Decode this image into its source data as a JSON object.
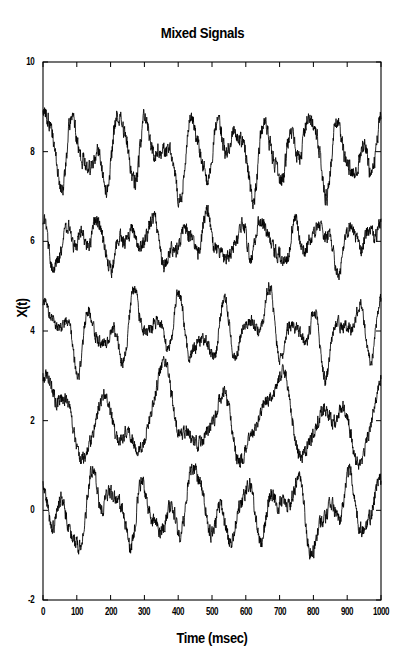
{
  "figure": {
    "title": "Mixed Signals",
    "background_color": "#ffffff",
    "line_color": "#000000",
    "axis_color": "#000000"
  },
  "axes": {
    "x_label": "Time (msec)",
    "y_label": "X(t)",
    "x_ticks": [
      "0",
      "100",
      "200",
      "300",
      "400",
      "500",
      "600",
      "700",
      "800",
      "900",
      "1000"
    ],
    "y_ticks": [
      "-2",
      "0",
      "2",
      "4",
      "6",
      "8",
      "10"
    ]
  },
  "chart_data": {
    "type": "line",
    "title": "Mixed Signals",
    "xlabel": "Time (msec)",
    "ylabel": "X(t)",
    "xlim": [
      0,
      1000
    ],
    "ylim": [
      -2,
      10
    ],
    "xticks": [
      0,
      100,
      200,
      300,
      400,
      500,
      600,
      700,
      800,
      900,
      1000
    ],
    "yticks": [
      -2,
      0,
      2,
      4,
      6,
      8,
      10
    ],
    "grid": false,
    "legend": "none",
    "n_series": 5,
    "series": [
      {
        "name": "mixture-1",
        "offset": 8,
        "amplitude": 0.95,
        "noise": 0.09,
        "components": [
          {
            "freq_hz": 14.0,
            "amp": 0.52,
            "phase": 0.3
          },
          {
            "freq_hz": 9.0,
            "amp": 0.4,
            "phase": 1.7
          },
          {
            "freq_hz": 23.0,
            "amp": 0.2,
            "phase": 2.4
          },
          {
            "freq_hz": 4.0,
            "amp": 0.22,
            "phase": 0.9
          }
        ]
      },
      {
        "name": "mixture-2",
        "offset": 6,
        "amplitude": 0.7,
        "noise": 0.08,
        "components": [
          {
            "freq_hz": 12.0,
            "amp": 0.42,
            "phase": 2.1
          },
          {
            "freq_hz": 19.0,
            "amp": 0.26,
            "phase": 0.45
          },
          {
            "freq_hz": 6.0,
            "amp": 0.3,
            "phase": 3.0
          },
          {
            "freq_hz": 27.0,
            "amp": 0.14,
            "phase": 1.1
          }
        ]
      },
      {
        "name": "mixture-3",
        "offset": 4,
        "amplitude": 0.9,
        "noise": 0.07,
        "components": [
          {
            "freq_hz": 15.0,
            "amp": 0.48,
            "phase": 1.25
          },
          {
            "freq_hz": 8.0,
            "amp": 0.34,
            "phase": 0.1
          },
          {
            "freq_hz": 22.0,
            "amp": 0.18,
            "phase": 2.75
          },
          {
            "freq_hz": 3.0,
            "amp": 0.24,
            "phase": 1.9
          }
        ]
      },
      {
        "name": "mixture-4",
        "offset": 2,
        "amplitude": 1.05,
        "noise": 0.075,
        "components": [
          {
            "freq_hz": 6.0,
            "amp": 0.62,
            "phase": 0.7
          },
          {
            "freq_hz": 11.0,
            "amp": 0.28,
            "phase": 2.3
          },
          {
            "freq_hz": 3.0,
            "amp": 0.3,
            "phase": 1.05
          },
          {
            "freq_hz": 17.0,
            "amp": 0.12,
            "phase": 0.25
          }
        ]
      },
      {
        "name": "mixture-5",
        "offset": 0,
        "amplitude": 0.95,
        "noise": 0.085,
        "components": [
          {
            "freq_hz": 13.0,
            "amp": 0.45,
            "phase": 2.55
          },
          {
            "freq_hz": 7.0,
            "amp": 0.38,
            "phase": 0.55
          },
          {
            "freq_hz": 21.0,
            "amp": 0.19,
            "phase": 1.4
          },
          {
            "freq_hz": 4.0,
            "amp": 0.26,
            "phase": 2.95
          }
        ]
      }
    ]
  }
}
